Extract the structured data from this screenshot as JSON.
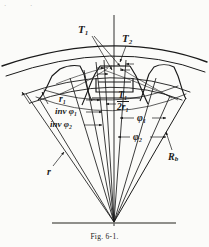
{
  "figure": {
    "caption_prefix": "Fig.",
    "caption_number": "6-1.",
    "caption_full": "Fig. 6-1.",
    "ink_color": "#1a1a1a",
    "paper_color": "#fbfbf9"
  },
  "labels": {
    "tooth_thickness_outer": "T₁",
    "tooth_thickness_second": "T₂",
    "pitch_radius": "r₁",
    "involute_phi1": "inv φ₁",
    "involute_phi2": "inv φ₂",
    "pressure_angle_1": "φ₁",
    "pressure_angle_2": "φ₂",
    "base_radius": "Rⁱb",
    "base_radius_display": "R",
    "base_radius_sub": "b",
    "radius_r": "r",
    "fraction_numerator": "T₁",
    "fraction_denominator": "2r₁",
    "fraction_num_base": "T",
    "fraction_num_sub": "1",
    "fraction_den_base": "2r",
    "fraction_den_sub": "1"
  },
  "label_parts": {
    "T_base": "T",
    "r_base": "r",
    "phi_base": "φ",
    "inv_prefix": "inv",
    "sub_1": "1",
    "sub_2": "2",
    "sub_b": "b"
  },
  "edge_marks": {
    "left_mark": "·",
    "second_mark": "·"
  },
  "geometry": {
    "apex_x": 114,
    "apex_y": 222,
    "addendum_arc_radius": 178,
    "pitch_arc_radius": 152,
    "base_arc_radius": 140,
    "root_arc_radius": 128
  }
}
